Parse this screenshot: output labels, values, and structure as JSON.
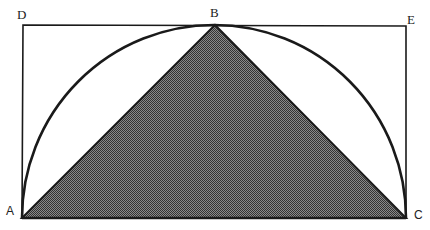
{
  "diagram": {
    "points": {
      "A": {
        "label": "A",
        "x": 22,
        "y": 218
      },
      "B": {
        "label": "B",
        "x": 215,
        "y": 25
      },
      "C": {
        "label": "C",
        "x": 406,
        "y": 218
      },
      "D": {
        "label": "D",
        "x": 23,
        "y": 25
      },
      "E": {
        "label": "E",
        "x": 406,
        "y": 26
      }
    },
    "shapes": {
      "rectangle": "D-E-C-A",
      "semicircle": "diameter AC, passing through B",
      "triangle": "A-B-C (shaded)"
    },
    "colors": {
      "stroke": "#1a1a1a",
      "fill_dark": "#3a3a3a",
      "fill_light": "#9a9a9a",
      "background": "#ffffff"
    }
  }
}
